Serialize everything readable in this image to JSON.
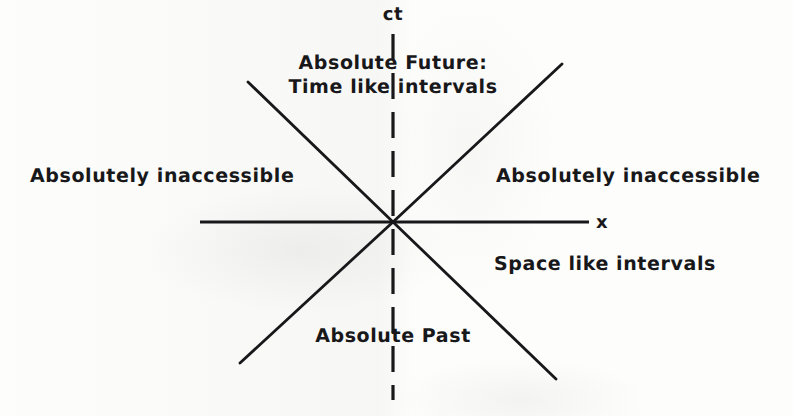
{
  "figure": {
    "kind": "minkowski-light-cone-diagram",
    "background_color": "#fdfdfc",
    "ink_color": "#18181a"
  },
  "axes": {
    "vertical": {
      "label": "ct",
      "x": 393,
      "y_top": 34,
      "y_bottom": 400,
      "dashed": true
    },
    "horizontal": {
      "label": "x",
      "y": 222,
      "x_left": 200,
      "x_right": 589,
      "dashed": false
    },
    "origin": {
      "x": 393,
      "y": 222
    }
  },
  "light_cone_lines": [
    {
      "name": "future-left",
      "x1": 393,
      "y1": 222,
      "x2": 248,
      "y2": 82
    },
    {
      "name": "future-right",
      "x1": 393,
      "y1": 222,
      "x2": 562,
      "y2": 64
    },
    {
      "name": "past-left",
      "x1": 393,
      "y1": 222,
      "x2": 240,
      "y2": 363
    },
    {
      "name": "past-right",
      "x1": 393,
      "y1": 222,
      "x2": 556,
      "y2": 379
    }
  ],
  "labels": {
    "ct_axis": "ct",
    "x_axis": "x",
    "future_line1": "Absolute Future:",
    "future_line2": "Time like intervals",
    "left_region": "Absolutely inaccessible",
    "right_region": "Absolutely inaccessible",
    "space_like": "Space like intervals",
    "past_region": "Absolute Past"
  },
  "chart_data": {
    "type": "line",
    "xlabel": "x",
    "ylabel": "ct",
    "grid": false,
    "legend": "none",
    "annotations": [
      {
        "text": "Absolute Future:",
        "region": "upper-cone",
        "x": 393,
        "y": 62
      },
      {
        "text": "Time like intervals",
        "region": "upper-cone",
        "x": 393,
        "y": 90
      },
      {
        "text": "Absolutely inaccessible",
        "region": "left-spacelike",
        "x": 167,
        "y": 177
      },
      {
        "text": "Absolutely inaccessible",
        "region": "right-spacelike",
        "x": 636,
        "y": 177
      },
      {
        "text": "Space like intervals",
        "region": "right-spacelike",
        "x": 619,
        "y": 265
      },
      {
        "text": "Absolute Past",
        "region": "lower-cone",
        "x": 393,
        "y": 337
      }
    ],
    "series": [
      {
        "name": "ct-axis (dashed)",
        "x": [
          393,
          393
        ],
        "y": [
          34,
          400
        ]
      },
      {
        "name": "x-axis",
        "x": [
          200,
          589
        ],
        "y": [
          222,
          222
        ]
      },
      {
        "name": "light-ray-future-left",
        "x": [
          393,
          248
        ],
        "y": [
          222,
          82
        ]
      },
      {
        "name": "light-ray-future-right",
        "x": [
          393,
          562
        ],
        "y": [
          222,
          64
        ]
      },
      {
        "name": "light-ray-past-left",
        "x": [
          393,
          240
        ],
        "y": [
          222,
          363
        ]
      },
      {
        "name": "light-ray-past-right",
        "x": [
          393,
          556
        ],
        "y": [
          222,
          379
        ]
      }
    ]
  }
}
